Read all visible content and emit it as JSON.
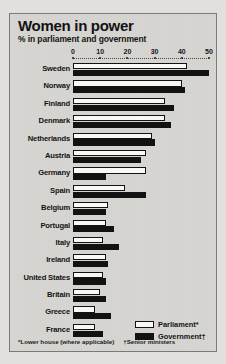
{
  "chart_data": {
    "type": "bar",
    "orientation": "horizontal",
    "title": "Women in power",
    "subtitle": "% in parliament and government",
    "xlabel": "",
    "ylabel": "",
    "xlim": [
      0,
      50
    ],
    "xticks": [
      0,
      10,
      20,
      30,
      40,
      50
    ],
    "xtick_labels": [
      "0",
      "10",
      "20",
      "30",
      "40",
      "50"
    ],
    "grid": false,
    "legend_position": "bottom-right",
    "categories": [
      "Sweden",
      "Norway",
      "Finland",
      "Denmark",
      "Netherlands",
      "Austria",
      "Germany",
      "Spain",
      "Belgium",
      "Portugal",
      "Italy",
      "Ireland",
      "United States",
      "Britain",
      "Greece",
      "France"
    ],
    "series": [
      {
        "name": "Parliament*",
        "color": "#fbfbf8",
        "values": [
          42,
          40,
          34,
          34,
          29,
          27,
          27,
          19,
          13,
          12,
          11,
          12,
          11,
          10,
          8,
          8
        ]
      },
      {
        "name": "Government†",
        "color": "#111111",
        "values": [
          50,
          41,
          37,
          36,
          30,
          25,
          12,
          27,
          12,
          15,
          17,
          13,
          12,
          12,
          14,
          11
        ]
      }
    ],
    "footnotes": [
      "*Lower house (where applicable)",
      "†Senior ministers"
    ]
  },
  "legend": {
    "items": [
      {
        "label": "Parliament*",
        "swatch": "white-outlined-swatch"
      },
      {
        "label": "Government†",
        "swatch": "black-filled-swatch"
      }
    ]
  },
  "colors": {
    "page_background": "#e4e3e1",
    "chart_background": "#d8d7d4",
    "frame_border": "#7c7b78",
    "ink": "#111111",
    "parliament_bar": "#fbfbf8",
    "government_bar": "#111111"
  }
}
